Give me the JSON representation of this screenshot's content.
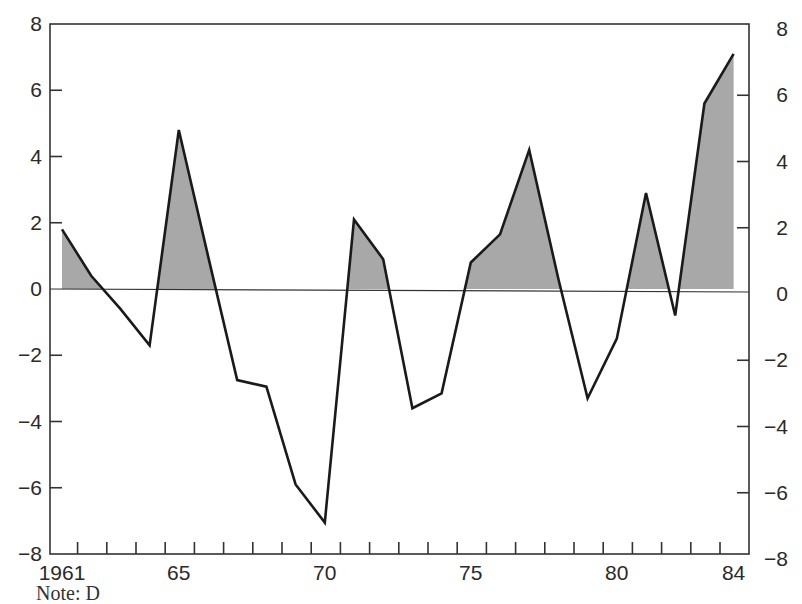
{
  "chart_data": {
    "type": "area",
    "title": "",
    "xlabel": "",
    "ylabel": "",
    "x": [
      1961,
      1962,
      1963,
      1964,
      1965,
      1966,
      1967,
      1968,
      1969,
      1970,
      1971,
      1972,
      1973,
      1974,
      1975,
      1976,
      1977,
      1978,
      1979,
      1980,
      1981,
      1982,
      1983,
      1984
    ],
    "series": [
      {
        "name": "value",
        "values": [
          1.8,
          0.4,
          -0.6,
          -1.7,
          4.8,
          1.0,
          -2.75,
          -2.95,
          -5.9,
          -7.05,
          2.1,
          0.9,
          -3.6,
          -3.15,
          0.8,
          1.65,
          4.2,
          0.3,
          -3.3,
          -1.5,
          2.9,
          -0.8,
          5.6,
          7.1
        ],
        "positive_fill": "#a8a8a8",
        "line_color": "#1a1a1a"
      }
    ],
    "ylim": [
      -8,
      8
    ],
    "xlim": [
      1961,
      1984
    ],
    "x_tick_labels": [
      {
        "year": 1961,
        "label": "1961"
      },
      {
        "year": 1965,
        "label": "65"
      },
      {
        "year": 1970,
        "label": "70"
      },
      {
        "year": 1975,
        "label": "75"
      },
      {
        "year": 1980,
        "label": "80"
      },
      {
        "year": 1984,
        "label": "84"
      }
    ],
    "y_ticks_left": [
      {
        "value": 8,
        "label": "8"
      },
      {
        "value": 6,
        "label": "6"
      },
      {
        "value": 4,
        "label": "4"
      },
      {
        "value": 2,
        "label": "2"
      },
      {
        "value": 0,
        "label": "0"
      },
      {
        "value": -2,
        "label": "−2"
      },
      {
        "value": -4,
        "label": "−4"
      },
      {
        "value": -6,
        "label": "−6"
      },
      {
        "value": -8,
        "label": "−8"
      }
    ],
    "y_ticks_right": [
      {
        "value": 8,
        "label": "8"
      },
      {
        "value": 6,
        "label": "6"
      },
      {
        "value": 4,
        "label": "4"
      },
      {
        "value": 2,
        "label": "2"
      },
      {
        "value": 0,
        "label": "0"
      },
      {
        "value": -2,
        "label": "−2"
      },
      {
        "value": -4,
        "label": "−4"
      },
      {
        "value": -6,
        "label": "−6"
      },
      {
        "value": -8,
        "label": "−8"
      }
    ],
    "grid": false,
    "zero_line": true,
    "legend": null,
    "annotations": []
  },
  "caption": {
    "text": "Note: D"
  }
}
